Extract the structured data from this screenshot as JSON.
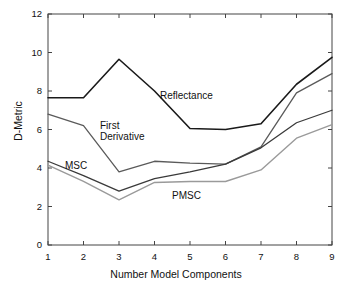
{
  "chart_data": {
    "type": "line",
    "title": "",
    "subtitle": "",
    "xlabel": "Number Model Components",
    "ylabel": "D-Metric",
    "x": [
      1,
      2,
      3,
      4,
      5,
      6,
      7,
      8,
      9
    ],
    "xlim": [
      1,
      9
    ],
    "ylim": [
      0,
      12
    ],
    "xticks": [
      "1",
      "2",
      "3",
      "4",
      "5",
      "6",
      "7",
      "8",
      "9"
    ],
    "yticks": [
      "0",
      "2",
      "4",
      "6",
      "8",
      "10",
      "12"
    ],
    "grid": false,
    "legend_position": "inline-annotations",
    "series": [
      {
        "name": "Reflectance",
        "color": "#1a1a1a",
        "width": 1.6,
        "values": [
          7.65,
          7.65,
          9.65,
          8.0,
          6.05,
          6.0,
          6.3,
          8.35,
          9.75
        ]
      },
      {
        "name": "First Derivative",
        "color": "#5a5a5a",
        "width": 1.3,
        "values": [
          6.8,
          6.2,
          3.8,
          4.35,
          4.25,
          4.2,
          5.1,
          7.9,
          8.9
        ]
      },
      {
        "name": "MSC",
        "color": "#3a3a3a",
        "width": 1.3,
        "values": [
          4.35,
          3.6,
          2.8,
          3.45,
          3.8,
          4.2,
          5.05,
          6.35,
          7.0
        ]
      },
      {
        "name": "PMSC",
        "color": "#9a9a9a",
        "width": 1.4,
        "values": [
          4.15,
          3.3,
          2.35,
          3.25,
          3.3,
          3.3,
          3.9,
          5.55,
          6.25
        ]
      }
    ],
    "annotations": [
      {
        "text": "Reflectance",
        "x": 160,
        "y": 90
      },
      {
        "text": "First",
        "x": 100,
        "y": 120
      },
      {
        "text": "Derivative",
        "x": 100,
        "y": 131
      },
      {
        "text": "MSC",
        "x": 65,
        "y": 160
      },
      {
        "text": "PMSC",
        "x": 172,
        "y": 190
      }
    ]
  },
  "axis_geometry": {
    "left": 48,
    "right": 332,
    "top": 14,
    "bottom": 245,
    "frame_color": "#444444"
  }
}
